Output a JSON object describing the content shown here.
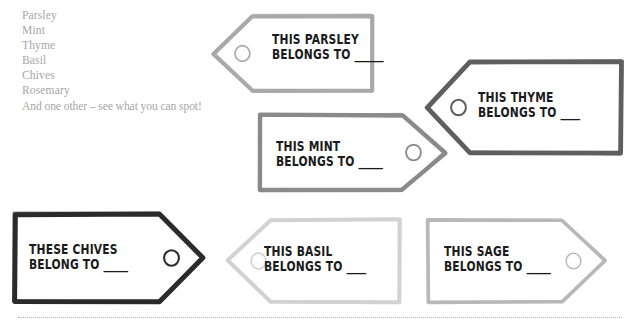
{
  "page": {
    "background": "#ffffff",
    "width": 635,
    "height": 333
  },
  "herb_list": {
    "name": "herb-name-list",
    "items": [
      "Parsley",
      "Mint",
      "Thyme",
      "Basil",
      "Chives",
      "Rosemary",
      "And one other – see what you can spot!"
    ],
    "text_color": "#a6a6a6"
  },
  "tags": [
    {
      "id": "parsley",
      "line1": "THIS PARSLEY",
      "line2": "BELONGS TO",
      "blank": "______",
      "outline_color": "#a9a9a9",
      "stroke_width": 4.2,
      "point_direction": "left",
      "x": 210,
      "y": 14,
      "w": 164,
      "h": 79,
      "text_x": 62,
      "text_y": 18
    },
    {
      "id": "thyme",
      "line1": "THIS THYME",
      "line2": "BELONGS TO",
      "blank": "____",
      "outline_color": "#5f5f5f",
      "stroke_width": 4.8,
      "point_direction": "left",
      "x": 424,
      "y": 60,
      "w": 199,
      "h": 95,
      "text_x": 54,
      "text_y": 30
    },
    {
      "id": "mint",
      "line1": "THIS MINT",
      "line2": "BELONGS TO",
      "blank": "_____",
      "outline_color": "#8a8a8a",
      "stroke_width": 4.4,
      "point_direction": "right",
      "x": 258,
      "y": 113,
      "w": 190,
      "h": 79,
      "text_x": 18,
      "text_y": 26
    },
    {
      "id": "chives",
      "line1": "THESE CHIVES",
      "line2": "BELONG TO",
      "blank": "_____",
      "outline_color": "#2b2b2b",
      "stroke_width": 5.0,
      "point_direction": "right",
      "x": 13,
      "y": 212,
      "w": 193,
      "h": 92,
      "text_x": 16,
      "text_y": 30
    },
    {
      "id": "basil",
      "line1": "THIS BASIL",
      "line2": "BELONGS TO",
      "blank": "____",
      "outline_color": "#d2d2d2",
      "stroke_width": 4.0,
      "point_direction": "left",
      "x": 224,
      "y": 218,
      "w": 178,
      "h": 86,
      "text_x": 40,
      "text_y": 26
    },
    {
      "id": "sage",
      "line1": "THIS SAGE",
      "line2": "BELONGS TO",
      "blank": "_____",
      "outline_color": "#b8b8b8",
      "stroke_width": 3.6,
      "point_direction": "right",
      "x": 426,
      "y": 218,
      "w": 182,
      "h": 86,
      "text_x": 18,
      "text_y": 26
    }
  ],
  "cut_line": {
    "name": "cut-line",
    "style": "dotted",
    "color": "#8f8f8f"
  }
}
